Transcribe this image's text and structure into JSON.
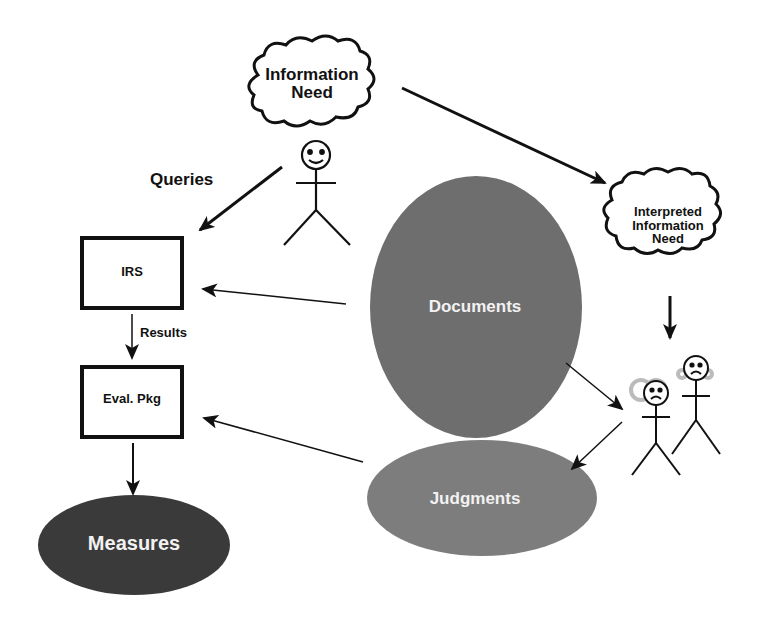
{
  "diagram": {
    "nodes": {
      "information_need": {
        "label_line1": "Information",
        "label_line2": "Need",
        "shape": "cloud"
      },
      "interpreted_need": {
        "label_line1": "Interpreted",
        "label_line2": "Information",
        "label_line3": "Need",
        "shape": "cloud"
      },
      "irs": {
        "label": "IRS",
        "shape": "box"
      },
      "eval_pkg": {
        "label": "Eval. Pkg",
        "shape": "box"
      },
      "measures": {
        "label": "Measures",
        "shape": "ellipse",
        "color": "#3a3a3a"
      },
      "documents": {
        "label": "Documents",
        "shape": "ellipse",
        "color": "#6e6e6e"
      },
      "judgments": {
        "label": "Judgments",
        "shape": "ellipse",
        "color": "#7d7d7d"
      },
      "user": {
        "shape": "stick-figure",
        "expression": "smiling"
      },
      "assessors": {
        "shape": "stick-figures",
        "count": 2,
        "expression": "frowning"
      }
    },
    "edge_labels": {
      "queries": "Queries",
      "results": "Results"
    }
  }
}
